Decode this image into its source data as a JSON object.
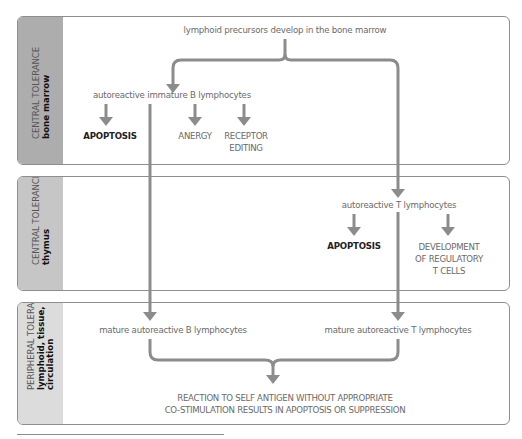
{
  "panels": [
    {
      "id": "central-bone-marrow",
      "label_line1": "CENTRAL TOLERANCE",
      "label_line2": "bone marrow"
    },
    {
      "id": "central-thymus",
      "label_line1": "CENTRAL TOLERANCE",
      "label_line2": "thymus"
    },
    {
      "id": "peripheral",
      "label_line1": "PERIPHERAL TOLERANCE",
      "label_line2": "lymphoid, tissue,",
      "label_line3": "circulation"
    }
  ],
  "nodes": {
    "origin": "lymphoid precursors develop in the bone marrow",
    "immature_b": "autoreactive immature B lymphocytes",
    "b_apoptosis": "APOPTOSIS",
    "b_anergy": "ANERGY",
    "b_receptor_editing_1": "RECEPTOR",
    "b_receptor_editing_2": "EDITING",
    "autoreactive_t": "autoreactive T lymphocytes",
    "t_apoptosis": "APOPTOSIS",
    "t_treg_1": "DEVELOPMENT",
    "t_treg_2": "OF REGULATORY",
    "t_treg_3": "T CELLS",
    "mature_b": "mature autoreactive B lymphocytes",
    "mature_t": "mature autoreactive T lymphocytes",
    "outcome_1": "REACTION TO SELF ANTIGEN WITHOUT APPROPRIATE",
    "outcome_2": "CO-STIMULATION RESULTS IN APOPTOSIS OR SUPPRESSION"
  },
  "colors": {
    "arrow": "#8c8c8c",
    "panel1_side": "#adadad",
    "panel2_side": "#c6c6c6",
    "panel3_side": "#dcdcdc"
  }
}
